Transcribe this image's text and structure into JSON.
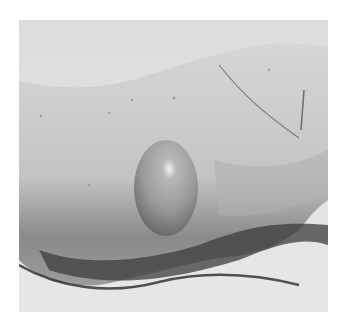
{
  "image": {
    "subject": "hand with large fluid-filled blister on side of palm",
    "colors": {
      "background": "#e4e4e4",
      "skin_light": "#d9d9d9",
      "skin_mid": "#bdbdbd",
      "skin_shadow": "#3a3a3a",
      "blister": "#9a9a9a",
      "blister_highlight": "#f2f2f2",
      "page": "#ffffff"
    }
  }
}
